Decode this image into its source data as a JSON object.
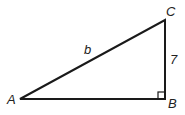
{
  "diagram": {
    "type": "right-triangle",
    "vertices": {
      "A": {
        "label": "A",
        "x": 20,
        "y": 99
      },
      "B": {
        "label": "B",
        "x": 165,
        "y": 99
      },
      "C": {
        "label": "C",
        "x": 165,
        "y": 20
      }
    },
    "sides": {
      "hypotenuse_AC": {
        "label": "b"
      },
      "leg_BC": {
        "label": "7"
      },
      "leg_AB": {
        "label": ""
      }
    },
    "right_angle_at": "B",
    "stroke_color": "#1a1a1a"
  }
}
